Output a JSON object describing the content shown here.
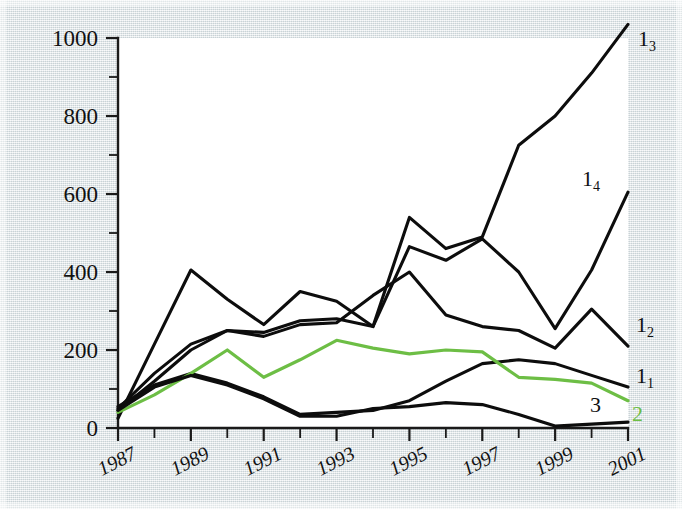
{
  "chart_data": {
    "type": "line",
    "title": "",
    "xlabel": "",
    "ylabel": "",
    "x": [
      1987,
      1988,
      1989,
      1990,
      1991,
      1992,
      1993,
      1994,
      1995,
      1996,
      1997,
      1998,
      1999,
      2000,
      2001
    ],
    "xlim": [
      1987,
      2001
    ],
    "ylim": [
      0,
      1000
    ],
    "grid": false,
    "legend_position": "right-inline",
    "y_tick_labels": [
      "0",
      "200",
      "400",
      "600",
      "800",
      "1000"
    ],
    "y_tick_values": [
      0,
      200,
      400,
      600,
      800,
      1000
    ],
    "y_minor_tick_values": [
      100,
      300,
      500,
      700,
      900
    ],
    "x_tick_labels": [
      "1987",
      "1989",
      "1991",
      "1993",
      "1995",
      "1997",
      "1999",
      "2001"
    ],
    "x_tick_values": [
      1987,
      1989,
      1991,
      1993,
      1995,
      1997,
      1999,
      2001
    ],
    "series": [
      {
        "name": "1_3",
        "label": "1",
        "sublabel": "3",
        "color": "#0d0d0d",
        "values": [
          25,
          215,
          405,
          330,
          265,
          350,
          325,
          260,
          540,
          460,
          490,
          725,
          800,
          910,
          1035
        ]
      },
      {
        "name": "1_4",
        "label": "1",
        "sublabel": "4",
        "color": "#0d0d0d",
        "values": [
          50,
          140,
          215,
          250,
          245,
          275,
          280,
          260,
          465,
          430,
          485,
          400,
          255,
          405,
          605
        ]
      },
      {
        "name": "1_2",
        "label": "1",
        "sublabel": "2",
        "color": "#0d0d0d",
        "values": [
          45,
          120,
          200,
          250,
          235,
          265,
          270,
          340,
          400,
          290,
          260,
          250,
          205,
          305,
          210
        ]
      },
      {
        "name": "1_1",
        "label": "1",
        "sublabel": "1",
        "color": "#0d0d0d",
        "values": [
          55,
          110,
          140,
          115,
          80,
          35,
          40,
          45,
          70,
          120,
          165,
          175,
          165,
          135,
          105
        ]
      },
      {
        "name": "2",
        "label": "2",
        "sublabel": "",
        "color": "#6dbe45",
        "values": [
          40,
          85,
          140,
          200,
          130,
          175,
          225,
          205,
          190,
          200,
          195,
          130,
          125,
          115,
          70
        ]
      },
      {
        "name": "3",
        "label": "3",
        "sublabel": "",
        "color": "#0d0d0d",
        "values": [
          45,
          105,
          135,
          110,
          75,
          30,
          30,
          50,
          55,
          65,
          60,
          35,
          5,
          10,
          15
        ]
      }
    ]
  }
}
